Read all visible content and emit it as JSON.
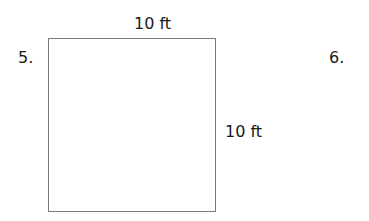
{
  "problems": [
    {
      "number": "5.",
      "shape": "square",
      "dimensions": {
        "top": "10 ft",
        "right": "10 ft"
      }
    },
    {
      "number": "6."
    }
  ]
}
